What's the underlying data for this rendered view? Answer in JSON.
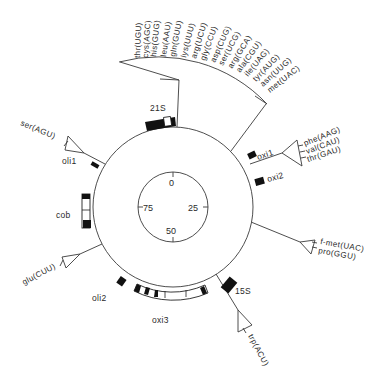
{
  "diagram": {
    "type": "circular genome map",
    "scale": {
      "ticks": [
        {
          "label": "0",
          "angle": 0
        },
        {
          "label": "25",
          "angle": 90
        },
        {
          "label": "50",
          "angle": 180
        },
        {
          "label": "75",
          "angle": 270
        }
      ]
    },
    "genes": [
      {
        "label": "21S"
      },
      {
        "label": "oxi1"
      },
      {
        "label": "oxi2"
      },
      {
        "label": "15S"
      },
      {
        "label": "oxi3"
      },
      {
        "label": "oli2"
      },
      {
        "label": "cob"
      },
      {
        "label": "oli1"
      }
    ],
    "trna_clusters": {
      "top_fan": [
        "thr(UGU)",
        "cys(AGC)",
        "his(GUG)",
        "leu(AAU)",
        "gln(GUU)",
        "lys(UUU)",
        "arg(UCU)",
        "gly(CCU)",
        "asp(CUG)",
        "ser(UCG)",
        "arg(GCA)",
        "ala(CGU)",
        "ile(UAG)",
        "tyr(AUG)",
        "asn(UUG)",
        "met(UAC)"
      ],
      "right_upper": [
        "phe(AAG)",
        "val(CAU)",
        "thr(GAU)"
      ],
      "right_lower": [
        "f-met(UAC)",
        "pro(GGU)"
      ],
      "bottom": [
        "trp(ACU)"
      ],
      "left_lower": [
        "glu(CUU)"
      ],
      "left_upper": [
        "ser(AGU)"
      ]
    },
    "colors": {
      "line": "#3a3a3a",
      "fill": "#111111",
      "background": "#ffffff"
    }
  }
}
